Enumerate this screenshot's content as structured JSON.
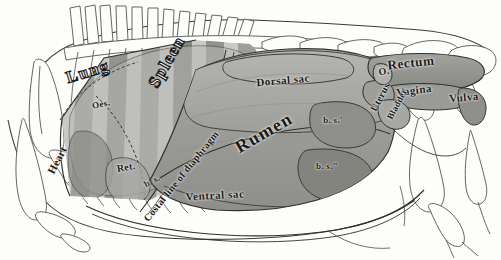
{
  "figure": {
    "kind": "anatomical-illustration",
    "background_color": "#fdfdfb",
    "ink_color": "#1a1a1a",
    "line_color": "#3a3a38"
  },
  "labels": [
    {
      "id": "lung",
      "text": "Lung",
      "x": 88,
      "y": 72,
      "size": 17,
      "rotate": -17,
      "spacing": 1.5,
      "style": "outline"
    },
    {
      "id": "oesophagus",
      "text": "Oes.",
      "x": 101,
      "y": 104,
      "size": 9,
      "rotate": -12,
      "spacing": 0.4,
      "style": "plain"
    },
    {
      "id": "spleen",
      "text": "Spleen",
      "x": 167,
      "y": 62,
      "size": 17,
      "rotate": -60,
      "spacing": 1.4,
      "style": "outline"
    },
    {
      "id": "diaphragm",
      "text": "Costal line of diaphragm",
      "x": 181,
      "y": 176,
      "size": 10,
      "rotate": -51,
      "spacing": 0.3,
      "style": "plain"
    },
    {
      "id": "heart",
      "text": "Heart",
      "x": 57,
      "y": 160,
      "size": 11,
      "rotate": -62,
      "spacing": 0.3,
      "style": "plain"
    },
    {
      "id": "reticulum",
      "text": "Ret.",
      "x": 126,
      "y": 167,
      "size": 10,
      "rotate": -10,
      "spacing": 0.3,
      "style": "plain"
    },
    {
      "id": "bs-left",
      "text": "b. s.",
      "x": 152,
      "y": 181,
      "size": 9,
      "rotate": -28,
      "spacing": 0.3,
      "style": "plain"
    },
    {
      "id": "dorsal-sac",
      "text": "Dorsal sac",
      "x": 283,
      "y": 80,
      "size": 11,
      "rotate": -5,
      "spacing": 0.5,
      "style": "plain"
    },
    {
      "id": "rumen",
      "text": "Rumen",
      "x": 264,
      "y": 133,
      "size": 18,
      "rotate": -30,
      "spacing": 1.4,
      "style": "plain"
    },
    {
      "id": "ventral-sac",
      "text": "Ventral sac",
      "x": 215,
      "y": 195,
      "size": 11,
      "rotate": -3,
      "spacing": 0.6,
      "style": "plain"
    },
    {
      "id": "bs-prime",
      "text": "b. s.'",
      "x": 333,
      "y": 120,
      "size": 9,
      "rotate": 0,
      "spacing": 0.3,
      "style": "plain"
    },
    {
      "id": "bs-dprime",
      "text": "b. s.\"",
      "x": 327,
      "y": 166,
      "size": 9,
      "rotate": 0,
      "spacing": 0.3,
      "style": "plain"
    },
    {
      "id": "rectum",
      "text": "Rectum",
      "x": 411,
      "y": 63,
      "size": 13,
      "rotate": -6,
      "spacing": 0.6,
      "style": "plain"
    },
    {
      "id": "vagina",
      "text": "Vagina",
      "x": 414,
      "y": 90,
      "size": 11,
      "rotate": -7,
      "spacing": 0.5,
      "style": "plain"
    },
    {
      "id": "vulva",
      "text": "Vulva",
      "x": 464,
      "y": 97,
      "size": 11,
      "rotate": -5,
      "spacing": 0.5,
      "style": "plain"
    },
    {
      "id": "ovary",
      "text": "O.",
      "x": 384,
      "y": 71,
      "size": 10,
      "rotate": -8,
      "spacing": 0.3,
      "style": "plain"
    },
    {
      "id": "uterus",
      "text": "Uterus",
      "x": 380,
      "y": 97,
      "size": 10,
      "rotate": -62,
      "spacing": 0.3,
      "style": "plain"
    },
    {
      "id": "bladder",
      "text": "Bladder",
      "x": 397,
      "y": 104,
      "size": 9,
      "rotate": -62,
      "spacing": 0.3,
      "style": "plain"
    }
  ]
}
